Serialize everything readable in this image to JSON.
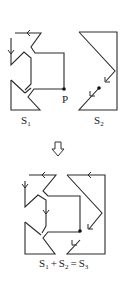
{
  "figure": {
    "top_left": {
      "name": "S",
      "subscript": "1",
      "point_label": "P"
    },
    "top_right": {
      "name": "S",
      "subscript": "2"
    },
    "transition": {
      "icon": "hollow-down-arrow-icon"
    },
    "bottom": {
      "equation": {
        "term1": "S",
        "term1_sub": "1",
        "plus": "+",
        "term2": "S",
        "term2_sub": "2",
        "equals": "=",
        "result": "S",
        "result_sub": "3"
      }
    },
    "colors": {
      "line": "#2a2a2a",
      "background": "#ffffff"
    }
  }
}
